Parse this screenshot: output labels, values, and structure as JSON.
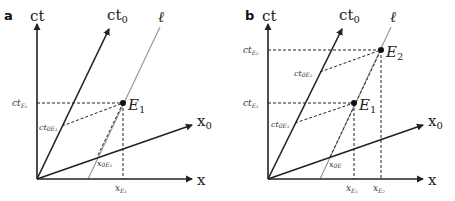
{
  "figure": {
    "panels": [
      {
        "id": "a",
        "panel_label": "a",
        "axes": {
          "ct": "ct",
          "ct0_base": "ct",
          "ct0_sub": "0",
          "x0_base": "x",
          "x0_sub": "0",
          "x": "x",
          "worldline": "ℓ"
        },
        "events": [
          {
            "name_base": "E",
            "name_sub": "1"
          }
        ],
        "projections": {
          "ct_E1": {
            "base": "ct",
            "sub": "E₁"
          },
          "ct0_E1": {
            "base": "ct",
            "sub": "0E₁"
          },
          "x0_E1": {
            "base": "x",
            "sub": "0E₁"
          },
          "x_E1": {
            "base": "x",
            "sub": "E₁"
          }
        }
      },
      {
        "id": "b",
        "panel_label": "b",
        "axes": {
          "ct": "ct",
          "ct0_base": "ct",
          "ct0_sub": "0",
          "x0_base": "x",
          "x0_sub": "0",
          "x": "x",
          "worldline": "ℓ"
        },
        "events": [
          {
            "name_base": "E",
            "name_sub": "1"
          },
          {
            "name_base": "E",
            "name_sub": "2"
          }
        ],
        "projections": {
          "ct_E1": {
            "base": "ct",
            "sub": "E₁"
          },
          "ct_E2": {
            "base": "ct",
            "sub": "E₂"
          },
          "ct0_E1": {
            "base": "ct",
            "sub": "0E₁"
          },
          "ct0_E2": {
            "base": "ct",
            "sub": "0E₂"
          },
          "x0_E": {
            "base": "x",
            "sub": "0E"
          },
          "x_E1": {
            "base": "x",
            "sub": "E₁"
          },
          "x_E2": {
            "base": "x",
            "sub": "E₂"
          }
        }
      }
    ],
    "colors": {
      "axis": "#222222",
      "worldline": "#9a9a9a",
      "dashed": "#222222"
    }
  }
}
